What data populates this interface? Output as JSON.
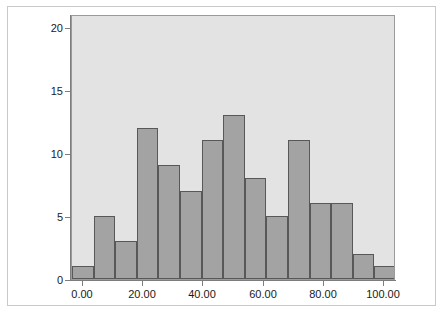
{
  "chart_data": {
    "type": "bar",
    "title": "",
    "subtitle": "",
    "xlabel": "",
    "ylabel": "",
    "grid": false,
    "legend": null,
    "xlim": [
      -3.6,
      104.0
    ],
    "ylim": [
      0,
      21
    ],
    "bin_width": 7.17,
    "x_tick_labels": [
      "0.00",
      "20.00",
      "40.00",
      "60.00",
      "80.00",
      "100.00"
    ],
    "x_tick_values": [
      0,
      20,
      40,
      60,
      80,
      100
    ],
    "y_tick_labels": [
      "0",
      "5",
      "10",
      "15",
      "20"
    ],
    "y_tick_values": [
      0,
      5,
      10,
      15,
      20
    ],
    "categories": [
      "-3.6 – 3.6",
      "3.6 – 10.7",
      "10.7 – 17.9",
      "17.9 – 25.1",
      "25.1 – 32.2",
      "32.2 – 39.4",
      "39.4 – 46.6",
      "46.6 – 53.7",
      "53.7 – 60.9",
      "60.9 – 68.1",
      "68.1 – 75.2",
      "75.2 – 82.4",
      "82.4 – 89.6",
      "89.6 – 96.7",
      "96.7 – 103.9"
    ],
    "values": [
      1,
      5,
      3,
      12,
      9,
      7,
      11,
      13,
      8,
      5,
      11,
      6,
      6,
      2,
      1
    ],
    "total_count": 100,
    "colors": {
      "bar_fill": "#a3a3a3",
      "bar_border": "#585858",
      "panel_background": "#e3e3e3",
      "panel_border": "#9a9a9a",
      "axis": "#7d7d7d",
      "figure_background": "#ffffff",
      "outer_frame": "#c9c9c9",
      "tick_text": "#1a1a1a"
    }
  }
}
